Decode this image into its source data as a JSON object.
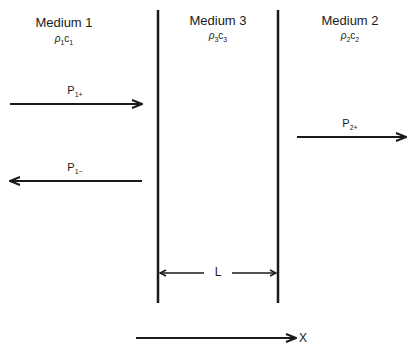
{
  "diagram": {
    "type": "acoustic-transmission-layer",
    "media": [
      {
        "id": "medium1",
        "title": "Medium 1",
        "param_rho": "ρ",
        "param_c": "c",
        "sub": "1",
        "center_x": 64
      },
      {
        "id": "medium3",
        "title": "Medium 3",
        "param_rho": "ρ",
        "param_c": "c",
        "sub": "3",
        "center_x": 218
      },
      {
        "id": "medium2",
        "title": "Medium 2",
        "param_rho": "ρ",
        "param_c": "c",
        "sub": "2",
        "center_x": 350
      }
    ],
    "waves": [
      {
        "id": "p1plus",
        "base": "P",
        "sub": "1+",
        "direction": "right",
        "x1": 10,
        "x2": 142,
        "y": 104
      },
      {
        "id": "p1minus",
        "base": "P",
        "sub": "1−",
        "direction": "left",
        "x1": 10,
        "x2": 142,
        "y": 181
      },
      {
        "id": "p2plus",
        "base": "P",
        "sub": "2+",
        "direction": "right",
        "x1": 297,
        "x2": 406,
        "y": 137
      }
    ],
    "boundaries": [
      {
        "id": "boundary-left",
        "x": 158,
        "y1": 10,
        "y2": 303
      },
      {
        "id": "boundary-right",
        "x": 278,
        "y1": 10,
        "y2": 303
      }
    ],
    "thickness": {
      "label": "L",
      "y": 273,
      "x1": 158,
      "x2": 278
    },
    "axis": {
      "label": "X",
      "x1": 136,
      "x2": 296,
      "y": 338
    },
    "colors": {
      "line": "#1a1a1a",
      "background": "#ffffff"
    }
  }
}
